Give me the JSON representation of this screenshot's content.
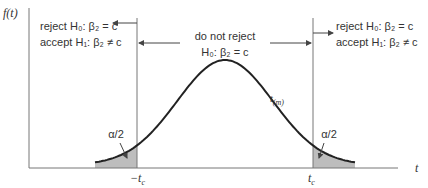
{
  "axes": {
    "y_label": "f(t)",
    "x_label": "t"
  },
  "regions": {
    "left": {
      "line1": "reject H₀: β₂ = c",
      "line2": "accept H₁: β₂ ≠ c"
    },
    "center": {
      "line1": "do not reject",
      "line2": "H₀: β₂ = c"
    },
    "right": {
      "line1": "reject H₀: β₂ = c",
      "line2": "accept H₁: β₂ ≠ c"
    }
  },
  "tails": {
    "left_label": "α/2",
    "right_label": "α/2"
  },
  "critical_values": {
    "left": "−t",
    "left_sub": "c",
    "right": "t",
    "right_sub": "c"
  },
  "curve_label": {
    "main": "t",
    "sub": "(m)"
  },
  "colors": {
    "line": "#222222",
    "axis": "#777777",
    "shade": "#bdbdbd"
  }
}
